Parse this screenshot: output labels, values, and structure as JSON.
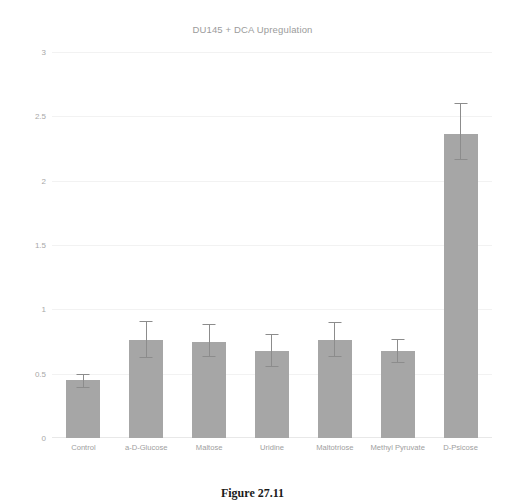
{
  "caption": {
    "text": "Figure 27.11"
  },
  "chart_data": {
    "type": "bar",
    "title": "DU145 + DCA Upregulation",
    "xlabel": "",
    "ylabel": "",
    "ylim": [
      0,
      3
    ],
    "yticks": [
      "0",
      "0.5",
      "1",
      "1.5",
      "2",
      "2.5",
      "3"
    ],
    "ytick_values": [
      0,
      0.5,
      1,
      1.5,
      2,
      2.5,
      3
    ],
    "grid": true,
    "legend": "none",
    "bar_color": "#a6a6a6",
    "error_color": "#8c8c8c",
    "categories": [
      "Control",
      "a-D-Glucose",
      "Maltose",
      "Uridine",
      "Maltotriose",
      "Methyl Pyruvate",
      "D-Psicose"
    ],
    "values": [
      0.45,
      0.76,
      0.75,
      0.68,
      0.76,
      0.68,
      2.36
    ],
    "errors_low": [
      0.39,
      0.62,
      0.63,
      0.55,
      0.63,
      0.58,
      2.16
    ],
    "errors_high": [
      0.5,
      0.91,
      0.89,
      0.81,
      0.9,
      0.77,
      2.6
    ]
  }
}
